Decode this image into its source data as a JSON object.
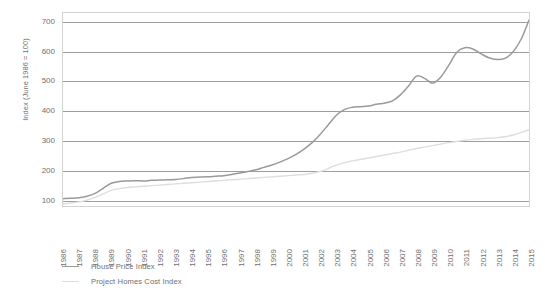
{
  "chart_data": {
    "type": "line",
    "title": "",
    "xlabel": "",
    "ylabel": "Index (June 1986 = 100)",
    "xlim": [
      1986,
      2015
    ],
    "ylim": [
      75,
      730
    ],
    "yticks": [
      100,
      200,
      300,
      400,
      500,
      600,
      700
    ],
    "grid": true,
    "legend_position": "below-left",
    "categories": [
      "1986",
      "1987",
      "1988",
      "1989",
      "1990",
      "1991",
      "1992",
      "1993",
      "1994",
      "1995",
      "1996",
      "1997",
      "1998",
      "1999",
      "2000",
      "2001",
      "2002",
      "2003",
      "2004",
      "2005",
      "2006",
      "2007",
      "2008",
      "2009",
      "2010",
      "2011",
      "2012",
      "2013",
      "2014",
      "2015"
    ],
    "series": [
      {
        "name": "House Price Index",
        "color": "#9a9a9a",
        "x": [
          1986.0,
          1986.5,
          1987.0,
          1987.5,
          1988.0,
          1988.5,
          1989.0,
          1989.5,
          1990.0,
          1990.5,
          1991.0,
          1991.5,
          1992.0,
          1992.5,
          1993.0,
          1993.5,
          1994.0,
          1994.5,
          1995.0,
          1995.5,
          1996.0,
          1996.5,
          1997.0,
          1997.5,
          1998.0,
          1998.5,
          1999.0,
          1999.5,
          2000.0,
          2000.5,
          2001.0,
          2001.5,
          2002.0,
          2002.5,
          2003.0,
          2003.5,
          2004.0,
          2004.5,
          2005.0,
          2005.5,
          2006.0,
          2006.5,
          2007.0,
          2007.5,
          2008.0,
          2008.5,
          2009.0,
          2009.5,
          2010.0,
          2010.5,
          2011.0,
          2011.5,
          2012.0,
          2012.5,
          2013.0,
          2013.5,
          2014.0,
          2014.5,
          2015.0
        ],
        "values": [
          100,
          101,
          103,
          108,
          118,
          135,
          152,
          158,
          160,
          161,
          160,
          162,
          163,
          164,
          165,
          168,
          172,
          173,
          174,
          176,
          178,
          182,
          187,
          192,
          198,
          206,
          214,
          224,
          236,
          250,
          268,
          290,
          318,
          350,
          382,
          402,
          410,
          412,
          414,
          420,
          424,
          432,
          452,
          482,
          516,
          508,
          492,
          512,
          552,
          596,
          612,
          608,
          592,
          578,
          572,
          576,
          598,
          640,
          706
        ]
      },
      {
        "name": "Project Homes Cost Index",
        "color": "#dedede",
        "x": [
          1986.0,
          1986.5,
          1987.0,
          1987.5,
          1988.0,
          1988.5,
          1989.0,
          1989.5,
          1990.0,
          1990.5,
          1991.0,
          1991.5,
          1992.0,
          1992.5,
          1993.0,
          1993.5,
          1994.0,
          1994.5,
          1995.0,
          1995.5,
          1996.0,
          1996.5,
          1997.0,
          1997.5,
          1998.0,
          1998.5,
          1999.0,
          1999.5,
          2000.0,
          2000.5,
          2001.0,
          2001.5,
          2002.0,
          2002.5,
          2003.0,
          2003.5,
          2004.0,
          2004.5,
          2005.0,
          2005.5,
          2006.0,
          2006.5,
          2007.0,
          2007.5,
          2008.0,
          2008.5,
          2009.0,
          2009.5,
          2010.0,
          2010.5,
          2011.0,
          2011.5,
          2012.0,
          2012.5,
          2013.0,
          2013.5,
          2014.0,
          2014.5,
          2015.0
        ],
        "values": [
          82,
          85,
          89,
          95,
          104,
          116,
          128,
          134,
          138,
          140,
          142,
          144,
          146,
          148,
          150,
          152,
          154,
          156,
          158,
          160,
          162,
          164,
          166,
          168,
          170,
          172,
          174,
          176,
          178,
          180,
          182,
          186,
          192,
          202,
          214,
          222,
          228,
          233,
          238,
          243,
          248,
          253,
          258,
          264,
          270,
          275,
          280,
          285,
          290,
          294,
          298,
          301,
          303,
          305,
          307,
          310,
          316,
          324,
          334
        ]
      }
    ]
  },
  "axes": {
    "y_title": "Index (June 1986 = 100)",
    "y_ticks": [
      "700",
      "600",
      "500",
      "400",
      "300",
      "200",
      "100"
    ],
    "x_ticks": [
      "1986",
      "1987",
      "1988",
      "1989",
      "1990",
      "1991",
      "1992",
      "1993",
      "1994",
      "1995",
      "1996",
      "1997",
      "1998",
      "1999",
      "2000",
      "2001",
      "2002",
      "2003",
      "2004",
      "2005",
      "2006",
      "2007",
      "2008",
      "2009",
      "2010",
      "2011",
      "2012",
      "2013",
      "2014",
      "2015"
    ]
  },
  "legend": {
    "items": [
      {
        "label": "House Price Index",
        "color": "#9a9a9a"
      },
      {
        "label": "Project Homes Cost Index",
        "color": "#dedede"
      }
    ]
  },
  "style": {
    "gridline_color": "#9e9e9e",
    "plot_border_color": "#d3d3d3",
    "text_color": "#6f6f6f",
    "background": "#ffffff"
  }
}
